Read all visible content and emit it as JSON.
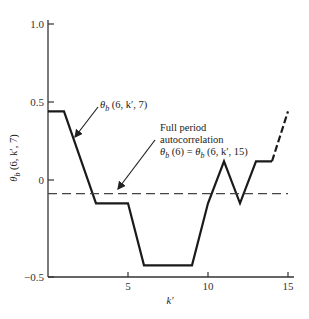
{
  "chart_data": {
    "type": "line",
    "title": "",
    "xlabel": "k′",
    "ylabel": "θb (6, k′, 7)",
    "xlim": [
      0,
      15
    ],
    "ylim": [
      -0.5,
      1.0
    ],
    "x_ticks": [
      {
        "value": 5,
        "label": "5"
      },
      {
        "value": 10,
        "label": "10"
      },
      {
        "value": 15,
        "label": "15"
      }
    ],
    "y_ticks": [
      {
        "value": 1.0,
        "label": "1.0"
      },
      {
        "value": 0.5,
        "label": "0.5"
      },
      {
        "value": 0,
        "label": "0"
      },
      {
        "value": -0.5,
        "label": "−0.5"
      }
    ],
    "grid": false,
    "series": [
      {
        "name": "θb (6, k′, 7)",
        "style": "solid",
        "x": [
          0,
          1,
          3,
          5,
          6,
          9,
          10,
          11,
          12,
          13,
          14
        ],
        "y": [
          0.44,
          0.44,
          -0.12,
          -0.12,
          -0.44,
          -0.44,
          -0.12,
          0.12,
          -0.12,
          0.12,
          0.12
        ]
      },
      {
        "name": "θb (6, k′, 7) continuation",
        "style": "dashed",
        "x": [
          14,
          15
        ],
        "y": [
          0.12,
          0.44
        ]
      },
      {
        "name": "Full period autocorrelation θb (6) = θb (6, k′, 15)",
        "style": "dashed-horizontal",
        "x": [
          0,
          15
        ],
        "y": [
          -0.07,
          -0.07
        ]
      }
    ],
    "annotations": [
      {
        "id": "curve-label",
        "lines": [
          "θb (6, k′, 7)"
        ],
        "arrow_to": {
          "x": 2.2,
          "y": 0.21
        }
      },
      {
        "id": "autocorr-label",
        "lines": [
          "Full period",
          "autocorrelation",
          "θb (6) = θb (6, k′, 15)"
        ],
        "arrow_to": {
          "x": 4.6,
          "y": -0.07
        }
      }
    ]
  },
  "labels": {
    "xlabel": "k′",
    "ylabel_theta": "θ",
    "ylabel_sub": "b",
    "ylabel_rest": " (6, k′, 7)",
    "ann1_theta": "θ",
    "ann1_sub": "b",
    "ann1_rest": " (6, k′, 7)",
    "ann2_line1": "Full period",
    "ann2_line2": "autocorrelation",
    "ann2_l3a": "θ",
    "ann2_l3b": "b",
    "ann2_l3c": " (6) = ",
    "ann2_l3d": "θ",
    "ann2_l3e": "b",
    "ann2_l3f": " (6, k′, 15)"
  }
}
